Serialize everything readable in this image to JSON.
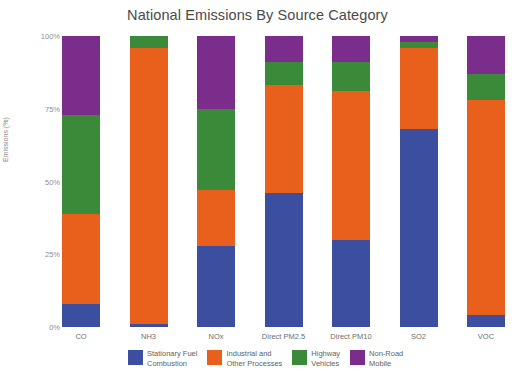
{
  "chart_data": {
    "type": "bar",
    "stacked": true,
    "title": "National Emissions By Source Category",
    "xlabel": "",
    "ylabel": "Emissions (%)",
    "ylim": [
      0,
      100
    ],
    "ytick_labels": [
      "0%",
      "25%",
      "50%",
      "75%",
      "100%"
    ],
    "ytick_values": [
      0,
      25,
      50,
      75,
      100
    ],
    "grid": false,
    "legend_position": "bottom",
    "categories": [
      "CO",
      "NH3",
      "NOx",
      "Direct PM2.5",
      "Direct PM10",
      "SO2",
      "VOC"
    ],
    "series": [
      {
        "name": "Stationary Fuel Combustion",
        "color": "#3b4ea0",
        "values": [
          8,
          1,
          28,
          46,
          30,
          68,
          4
        ]
      },
      {
        "name": "Industrial and Other Processes",
        "color": "#e8601c",
        "values": [
          31,
          95,
          19,
          37,
          51,
          28,
          74
        ]
      },
      {
        "name": "Highway Vehicles",
        "color": "#3a8a3a",
        "values": [
          34,
          4,
          28,
          8,
          10,
          2,
          9
        ]
      },
      {
        "name": "Non-Road Mobile",
        "color": "#7b2d8b",
        "values": [
          27,
          0,
          25,
          9,
          9,
          2,
          13
        ]
      }
    ]
  },
  "legend": {
    "items": [
      {
        "label": "Stationary Fuel\nCombustion",
        "color": "#3b4ea0"
      },
      {
        "label": "Industrial and\nOther Processes",
        "color": "#e8601c"
      },
      {
        "label": "Highway\nVehicles",
        "color": "#3a8a3a"
      },
      {
        "label": "Non-Road\nMobile",
        "color": "#7b2d8b"
      }
    ]
  }
}
